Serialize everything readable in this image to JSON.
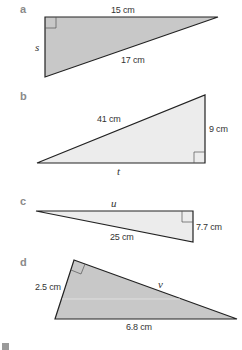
{
  "colors": {
    "fill_dark": "#c8c8c8",
    "fill_light": "#ececec",
    "stroke": "#222222",
    "part_label": "#8a8a8a"
  },
  "triangles": [
    {
      "part": "a",
      "right_angle": "top-left",
      "sides": [
        {
          "side": "top",
          "label": "15 cm"
        },
        {
          "side": "left",
          "label": "s",
          "unknown": true
        },
        {
          "side": "hypotenuse",
          "label": "17 cm"
        }
      ]
    },
    {
      "part": "b",
      "right_angle": "bottom-right",
      "sides": [
        {
          "side": "hypotenuse",
          "label": "41 cm"
        },
        {
          "side": "right",
          "label": "9 cm"
        },
        {
          "side": "bottom",
          "label": "t",
          "unknown": true
        }
      ]
    },
    {
      "part": "c",
      "right_angle": "top-right",
      "sides": [
        {
          "side": "top",
          "label": "u",
          "unknown": true
        },
        {
          "side": "right",
          "label": "7.7 cm"
        },
        {
          "side": "hypotenuse",
          "label": "25 cm"
        }
      ]
    },
    {
      "part": "d",
      "right_angle": "apex",
      "sides": [
        {
          "side": "left",
          "label": "2.5 cm"
        },
        {
          "side": "right",
          "label": "v",
          "unknown": true
        },
        {
          "side": "hypotenuse",
          "label": "6.8 cm"
        }
      ]
    }
  ]
}
